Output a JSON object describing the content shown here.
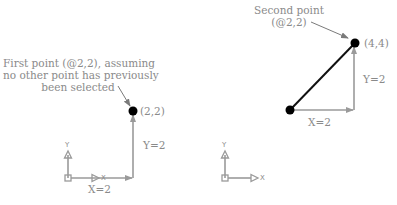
{
  "left_panel": {
    "annotation_line1": "First point (@2,2), assuming",
    "annotation_line2": "no other point has previously",
    "annotation_line3": "been selected",
    "point_label": "(2,2)",
    "x_delta_label": "X=2",
    "y_delta_label": "Y=2",
    "ucs_x": "X",
    "ucs_y": "Y"
  },
  "right_panel": {
    "annotation_line1": "Second point",
    "annotation_line2": "(@2,2)",
    "point_label": "(4,4)",
    "x_delta_label": "X=2",
    "y_delta_label": "Y=2",
    "ucs_x": "X",
    "ucs_y": "Y"
  },
  "colors": {
    "line_gray": "#9a9a9a",
    "text_gray": "#8a8a8a",
    "point": "#000000",
    "segment": "#111111"
  }
}
